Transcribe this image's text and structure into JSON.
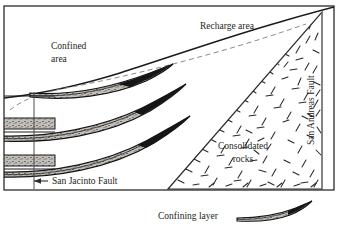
{
  "figure": {
    "kind": "geologic-cross-section",
    "title_visible": false,
    "frame": {
      "x": 4,
      "y": 6,
      "width": 330,
      "height": 184,
      "stroke": "#2b2b2b"
    }
  },
  "labels": {
    "recharge_area": "Recharge area",
    "confined_area_line1": "Confined",
    "confined_area_line2": "area",
    "consolidated_line1": "Consolidated",
    "consolidated_line2": "rocks",
    "san_andreas_fault": "San Andreas Fault",
    "san_jacinto_fault": "San Jacinto Fault"
  },
  "legend": {
    "label": "Confining layer",
    "symbol": "confining-layer-lens"
  },
  "colors": {
    "ink": "#231f20",
    "line": "#2b2b2b",
    "confining_fill": "#b8b5b0",
    "confining_dark": "#1a1a1a",
    "water_table_dash": "#8d8a86",
    "page_background": "#ffffff"
  },
  "elements": {
    "land_surface": "land-surface-curve",
    "water_table": "potentiometric-dashed-curve",
    "san_andreas_fault_line": "vertical-fault-line-right",
    "san_jacinto_fault_line": "vertical-fault-line-left",
    "consolidated_rock_pattern": "dash-stipple",
    "confining_layers_count": 3,
    "jacinto_arrow": "left-arrow"
  }
}
